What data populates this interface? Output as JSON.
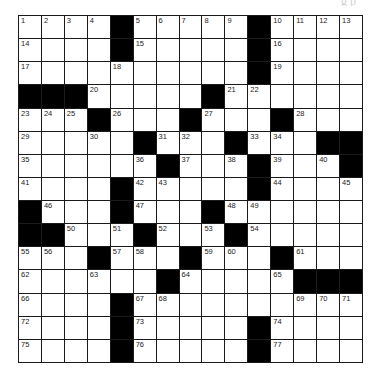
{
  "header": {
    "partial_text": "g                  p"
  },
  "puzzle": {
    "rows": 15,
    "cols": 15,
    "grid": [
      [
        "1",
        "2",
        "3",
        "4",
        "#",
        "5",
        "6",
        "7",
        "8",
        "9",
        "#",
        "10",
        "11",
        "12",
        "13"
      ],
      [
        "14",
        "",
        "",
        "",
        "#",
        "15",
        "",
        "",
        "",
        "",
        "#",
        "16",
        "",
        "",
        ""
      ],
      [
        "17",
        "",
        "",
        "",
        "18",
        "",
        "",
        "",
        "",
        "",
        "#",
        "19",
        "",
        "",
        ""
      ],
      [
        "#",
        "#",
        "#",
        "20",
        "",
        "",
        "",
        "",
        "#",
        "21",
        "22",
        "",
        "",
        "",
        ""
      ],
      [
        "23",
        "24",
        "25",
        "#",
        "26",
        "",
        "",
        "#",
        "27",
        "",
        "",
        "#",
        "28",
        "",
        ""
      ],
      [
        "29",
        "",
        "",
        "30",
        "",
        "#",
        "31",
        "32",
        "",
        "#",
        "33",
        "34",
        "",
        "#",
        "#"
      ],
      [
        "35",
        "",
        "",
        "",
        "",
        "36",
        "#",
        "37",
        "",
        "38",
        "#",
        "39",
        "",
        "40",
        "#"
      ],
      [
        "41",
        "",
        "",
        "",
        "#",
        "42",
        "43",
        "",
        "",
        "",
        "#",
        "44",
        "",
        "",
        "45"
      ],
      [
        "#",
        "46",
        "",
        "",
        "#",
        "47",
        "",
        "",
        "#",
        "48",
        "49",
        "",
        "",
        "",
        ""
      ],
      [
        "#",
        "#",
        "50",
        "",
        "51",
        "#",
        "52",
        "",
        "53",
        "#",
        "54",
        "",
        "",
        "",
        ""
      ],
      [
        "55",
        "56",
        "",
        "#",
        "57",
        "58",
        "",
        "#",
        "59",
        "60",
        "",
        "#",
        "61",
        "",
        ""
      ],
      [
        "62",
        "",
        "",
        "63",
        "",
        "",
        "#",
        "64",
        "",
        "",
        "",
        "65",
        "#",
        "#",
        "#"
      ],
      [
        "66",
        "",
        "",
        "",
        "#",
        "67",
        "68",
        "",
        "",
        "",
        "",
        "",
        "69",
        "70",
        "71"
      ],
      [
        "72",
        "",
        "",
        "",
        "#",
        "73",
        "",
        "",
        "",
        "",
        "#",
        "74",
        "",
        "",
        ""
      ],
      [
        "75",
        "",
        "",
        "",
        "#",
        "76",
        "",
        "",
        "",
        "",
        "#",
        "77",
        "",
        "",
        ""
      ]
    ],
    "colors": {
      "block": "#000000",
      "cell": "#ffffff",
      "line": "#1a1a1a"
    }
  }
}
